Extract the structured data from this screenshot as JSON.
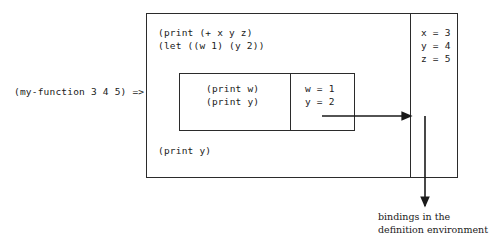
{
  "diagram": {
    "call_label": "(my-function 3 4 5) =>",
    "outer_frame": {
      "name": "function-body-frame",
      "code_top": "(print (+ x y z)\n(let ((w 1) (y 2))",
      "code_bottom": "(print y)",
      "bindings_label": "x = 3\ny = 4\nz = 5",
      "bindings": [
        {
          "name": "x",
          "value": "3",
          "text": "x = 3"
        },
        {
          "name": "y",
          "value": "4",
          "text": "y = 4"
        },
        {
          "name": "z",
          "value": "5",
          "text": "z = 5"
        }
      ]
    },
    "inner_frame": {
      "name": "let-frame",
      "code": "(print w)\n(print y)",
      "bindings_label": "w = 1\ny = 2",
      "bindings": [
        {
          "name": "w",
          "value": "1",
          "text": "w = 1"
        },
        {
          "name": "y",
          "value": "2",
          "text": "y = 2"
        }
      ]
    },
    "caption": "bindings in the\ndefinition environment",
    "colors": {
      "stroke": "#2b2b2b",
      "text": "#1a1a1a",
      "background": "#ffffff"
    }
  }
}
